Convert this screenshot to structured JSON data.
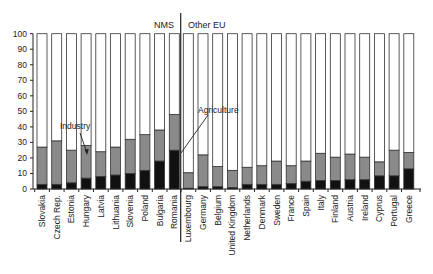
{
  "chart_data": {
    "type": "bar",
    "stacked": true,
    "percent_stacked": true,
    "title": "",
    "xlabel": "",
    "ylabel": "",
    "ylim": [
      0,
      100
    ],
    "yticks": [
      0,
      10,
      20,
      30,
      40,
      50,
      60,
      70,
      80,
      90,
      100
    ],
    "grid": false,
    "legend": "none (inline annotations)",
    "groups": [
      {
        "label": "NMS",
        "categories": [
          "Slovakia",
          "Czech Rep.",
          "Estonia",
          "Hungary",
          "Latvia",
          "Lithuania",
          "Slovenia",
          "Poland",
          "Bulgaria",
          "Romania"
        ]
      },
      {
        "label": "Other EU",
        "categories": [
          "Luxembourg",
          "Germany",
          "Belgium",
          "United Kingdom",
          "Netherlands",
          "Denmark",
          "Sweden",
          "France",
          "Spain",
          "Italy",
          "Finland",
          "Austria",
          "Ireland",
          "Cyprus",
          "Portugal",
          "Greece"
        ]
      }
    ],
    "categories": [
      "Slovakia",
      "Czech Rep.",
      "Estonia",
      "Hungary",
      "Latvia",
      "Lithuania",
      "Slovenia",
      "Poland",
      "Bulgaria",
      "Romania",
      "Luxembourg",
      "Germany",
      "Belgium",
      "United Kingdom",
      "Netherlands",
      "Denmark",
      "Sweden",
      "France",
      "Spain",
      "Italy",
      "Finland",
      "Austria",
      "Ireland",
      "Cyprus",
      "Portugal",
      "Greece"
    ],
    "series": [
      {
        "name": "Agriculture",
        "color": "#111111",
        "values": [
          3,
          3,
          4,
          7,
          8,
          9,
          10,
          12,
          18,
          25,
          0.5,
          1.5,
          1.5,
          1,
          3,
          3,
          3,
          3.5,
          5,
          5.5,
          5.5,
          6,
          6,
          8.5,
          8.5,
          13
        ]
      },
      {
        "name": "Industry",
        "color": "#8a8a8a",
        "values": [
          24,
          28,
          21,
          21,
          16,
          18,
          22,
          23,
          20,
          23,
          10,
          20.5,
          13,
          11,
          11,
          12,
          15,
          11.5,
          13,
          17.5,
          15,
          16.5,
          14.5,
          9,
          16.5,
          10.5
        ]
      },
      {
        "name": "Services",
        "color": "#ffffff",
        "values": [
          73,
          69,
          75,
          72,
          76,
          73,
          68,
          65,
          62,
          52,
          89.5,
          78,
          85.5,
          88,
          86,
          85,
          82,
          85,
          82,
          77,
          79.5,
          77.5,
          79.5,
          82.5,
          75,
          76.5
        ]
      }
    ],
    "annotations": [
      {
        "text": "Industry",
        "points_to": "Hungary industry segment"
      },
      {
        "text": "Agriculture",
        "points_to": "Romania agriculture segment"
      }
    ]
  }
}
